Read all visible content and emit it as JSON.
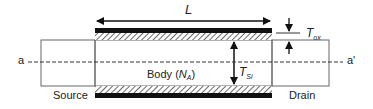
{
  "diagram": {
    "labels": {
      "length": "L",
      "oxide_thickness_main": "T",
      "oxide_thickness_sub": "ox",
      "silicon_thickness_main": "T",
      "silicon_thickness_sub": "Si",
      "body_prefix": "Body (",
      "body_doping_main": "N",
      "body_doping_sub": "A",
      "body_suffix": ")",
      "source": "Source",
      "drain": "Drain",
      "cut_start": "a",
      "cut_end": "a'"
    },
    "colors": {
      "line": "#333333",
      "gate": "#111111",
      "hatch": "#444444",
      "background": "#ffffff"
    }
  }
}
